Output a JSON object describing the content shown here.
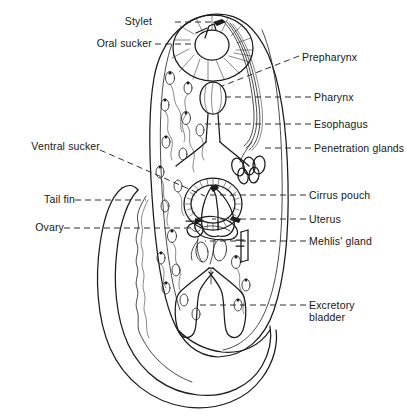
{
  "figure": {
    "ink_color": "#1a1a1a",
    "background_color": "#ffffff",
    "leader_line_style": "dashed"
  },
  "labels_left": [
    {
      "id": "stylet",
      "text": "Stylet",
      "x": 152,
      "y": 22,
      "leader_to_x": 196,
      "leader_to_y": 22
    },
    {
      "id": "oral-sucker",
      "text": "Oral sucker",
      "x": 152,
      "y": 44,
      "leader_to_x": 185,
      "leader_to_y": 44
    },
    {
      "id": "ventral-sucker",
      "text": "Ventral sucker",
      "x": 100,
      "y": 147,
      "leader_to_x": 196,
      "leader_to_y": 190
    },
    {
      "id": "tail-fin",
      "text": "Tail fin",
      "x": 70,
      "y": 200,
      "leader_to_x": 120,
      "leader_to_y": 200
    },
    {
      "id": "ovary",
      "text": "Ovary",
      "x": 62,
      "y": 228,
      "leader_to_x": 196,
      "leader_to_y": 228
    }
  ],
  "labels_right": [
    {
      "id": "prepharynx",
      "text": "Prepharynx",
      "x": 302,
      "y": 58,
      "leader_to_x": 215,
      "leader_to_y": 88
    },
    {
      "id": "pharynx",
      "text": "Pharynx",
      "x": 315,
      "y": 97,
      "leader_to_x": 222,
      "leader_to_y": 97
    },
    {
      "id": "esophagus",
      "text": "Esophagus",
      "x": 315,
      "y": 124,
      "leader_to_x": 210,
      "leader_to_y": 124
    },
    {
      "id": "penetration-glands",
      "text": "Penetration glands",
      "x": 315,
      "y": 148,
      "leader_to_x": 255,
      "leader_to_y": 148
    },
    {
      "id": "cirrus-pouch",
      "text": "Cirrus pouch",
      "x": 310,
      "y": 195,
      "leader_to_x": 215,
      "leader_to_y": 195
    },
    {
      "id": "uterus",
      "text": "Uterus",
      "x": 310,
      "y": 219,
      "leader_to_x": 218,
      "leader_to_y": 219
    },
    {
      "id": "mehlis-gland",
      "text": "Mehlis' gland",
      "x": 310,
      "y": 241,
      "leader_to_x": 246,
      "leader_to_y": 241
    },
    {
      "id": "excretory-bladder",
      "text": "Excretory\nbladder",
      "x": 310,
      "y": 299,
      "leader_to_x": 205,
      "leader_to_y": 305
    }
  ],
  "structures": [
    {
      "id": "body-outline",
      "name": "body-outline"
    },
    {
      "id": "oral-sucker-organ",
      "name": "oral-sucker"
    },
    {
      "id": "stylet-organ",
      "name": "stylet"
    },
    {
      "id": "prepharynx-organ",
      "name": "prepharynx"
    },
    {
      "id": "pharynx-organ",
      "name": "pharynx"
    },
    {
      "id": "esophagus-organ",
      "name": "esophagus"
    },
    {
      "id": "penetration-glands-organ",
      "name": "penetration-glands"
    },
    {
      "id": "ventral-sucker-organ",
      "name": "ventral-sucker"
    },
    {
      "id": "cirrus-pouch-organ",
      "name": "cirrus-pouch"
    },
    {
      "id": "uterus-organ",
      "name": "uterus"
    },
    {
      "id": "ovary-organ",
      "name": "ovary"
    },
    {
      "id": "mehlis-gland-organ",
      "name": "mehlis-gland"
    },
    {
      "id": "excretory-bladder-organ",
      "name": "excretory-bladder"
    },
    {
      "id": "tail-organ",
      "name": "tail"
    },
    {
      "id": "tail-fin-organ",
      "name": "tail-fin"
    },
    {
      "id": "cystogenous-glands",
      "name": "cystogenous-gland-cells"
    }
  ]
}
